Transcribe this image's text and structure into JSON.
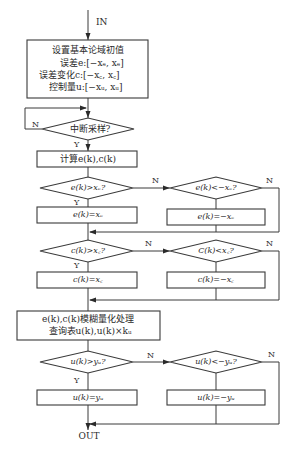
{
  "flowchart": {
    "entry_label": "IN",
    "exit_label": "OUT",
    "init_box": {
      "title": "设置基本论域初值",
      "line_error": "误差e:[−xₑ, xₑ]",
      "line_error_change": "误差变化c:[−x꜀, x꜀]",
      "line_control": "控制量u:[−xᵤ, xᵤ]"
    },
    "interrupt_decision": {
      "text": "中断采样?",
      "no_label": "N",
      "yes_label": "Y"
    },
    "compute_box": {
      "text": "计算e(k),c(k)"
    },
    "error_block": {
      "upper_check": {
        "text": "e(k)>xₑ?",
        "yes_label": "Y",
        "no_label": "N"
      },
      "lower_check": {
        "text": "e(k)<−xₑ?",
        "no_label": "N"
      },
      "clamp_upper": {
        "text": "e(k)=xₑ"
      },
      "clamp_lower": {
        "text": "e(k)=−xₑ"
      }
    },
    "change_block": {
      "upper_check": {
        "text": "c(k)>x꜀?",
        "yes_label": "Y",
        "no_label": "N"
      },
      "lower_check": {
        "text": "C(k)<x꜀?",
        "no_label": "N"
      },
      "clamp_upper": {
        "text": "c(k)=x꜀"
      },
      "clamp_lower": {
        "text": "c(k)=−x꜀"
      }
    },
    "fuzzy_box": {
      "line1": "e(k),c(k)模糊量化处理",
      "line2": "查询表u(k),u(k)×kᵤ"
    },
    "control_block": {
      "upper_check": {
        "text": "u(k)>yᵤ?",
        "yes_label": "Y",
        "no_label": "N"
      },
      "lower_check": {
        "text": "u(k)<−yᵤ?",
        "no_label": "N"
      },
      "clamp_upper": {
        "text": "u(k)=yᵤ"
      },
      "clamp_lower": {
        "text": "u(k)=−yᵤ"
      }
    }
  }
}
